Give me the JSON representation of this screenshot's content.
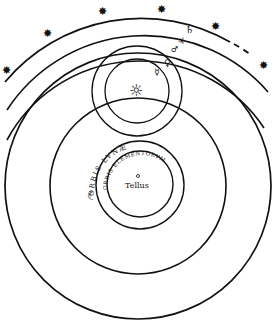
{
  "diagram": {
    "type": "cosmological-system",
    "labels": {
      "center": "Tellus",
      "moon_orbit": "ORBIS LVNÆ",
      "elements_orbit": "ORBIS ELEMENTORVM"
    },
    "symbols": {
      "saturn": "♄",
      "jupiter": "♃",
      "mars": "♂",
      "venus": "♀",
      "mercury": "☿",
      "moon": "☾",
      "sun": "☼",
      "star": "✸"
    },
    "colors": {
      "ink": "#111111",
      "paper": "#ffffff"
    }
  }
}
